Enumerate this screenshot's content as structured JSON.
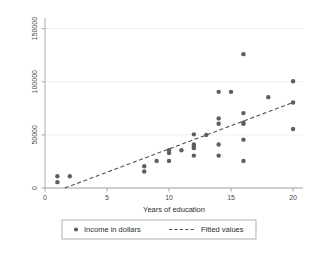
{
  "chart_data": {
    "type": "scatter",
    "title": "",
    "xlabel": "Years of education",
    "ylabel": "",
    "xlim": [
      0,
      20.8
    ],
    "ylim": [
      0,
      160000
    ],
    "xticks": [
      0,
      5,
      10,
      15,
      20
    ],
    "xtick_labels": [
      "0",
      "5",
      "10",
      "15",
      "20"
    ],
    "yticks": [
      0,
      50000,
      100000,
      150000
    ],
    "ytick_labels": [
      "0",
      "50000",
      "100000",
      "150000"
    ],
    "grid": true,
    "legend_position": "bottom",
    "series": [
      {
        "name": "Income in dollars",
        "type": "scatter",
        "marker": "circle",
        "color": "#5a5f66",
        "points": [
          {
            "x": 1,
            "y": 11000
          },
          {
            "x": 1,
            "y": 5500
          },
          {
            "x": 2,
            "y": 11000
          },
          {
            "x": 8,
            "y": 20500
          },
          {
            "x": 8,
            "y": 15500
          },
          {
            "x": 9,
            "y": 25500
          },
          {
            "x": 10,
            "y": 35500
          },
          {
            "x": 10,
            "y": 33000
          },
          {
            "x": 10,
            "y": 25500
          },
          {
            "x": 11,
            "y": 35500
          },
          {
            "x": 12,
            "y": 50500
          },
          {
            "x": 12,
            "y": 41000
          },
          {
            "x": 12,
            "y": 39500
          },
          {
            "x": 12,
            "y": 37500
          },
          {
            "x": 12,
            "y": 30500
          },
          {
            "x": 13,
            "y": 50000
          },
          {
            "x": 14,
            "y": 90500
          },
          {
            "x": 14,
            "y": 65500
          },
          {
            "x": 14,
            "y": 60500
          },
          {
            "x": 14,
            "y": 41000
          },
          {
            "x": 14,
            "y": 30500
          },
          {
            "x": 15,
            "y": 90500
          },
          {
            "x": 16,
            "y": 126000
          },
          {
            "x": 16,
            "y": 70500
          },
          {
            "x": 16,
            "y": 61500
          },
          {
            "x": 16,
            "y": 60500
          },
          {
            "x": 16,
            "y": 45500
          },
          {
            "x": 16,
            "y": 25500
          },
          {
            "x": 18,
            "y": 85500
          },
          {
            "x": 20,
            "y": 100500
          },
          {
            "x": 20,
            "y": 80500
          },
          {
            "x": 20,
            "y": 55500
          }
        ]
      },
      {
        "name": "Fitted values",
        "type": "line",
        "style": "dashed",
        "color": "#4d5359",
        "x": [
          1.6,
          20
        ],
        "values": [
          0,
          80500
        ]
      }
    ],
    "legend": [
      {
        "label": "Income in dollars",
        "marker": "circle",
        "color": "#5a5f66"
      },
      {
        "label": "Fitted values",
        "marker": "dashed-line",
        "color": "#4d5359"
      }
    ]
  }
}
